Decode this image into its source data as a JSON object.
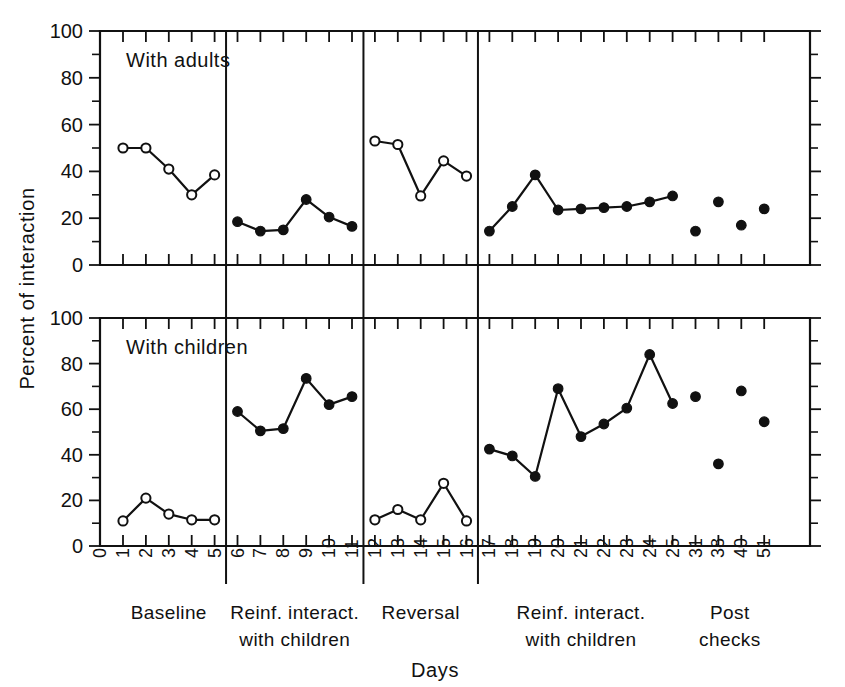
{
  "figure": {
    "xaxis_title": "Days",
    "yaxis_title": "Percent of interaction"
  },
  "panels": [
    {
      "key": "adults",
      "title": "With adults"
    },
    {
      "key": "children",
      "title": "With children"
    }
  ],
  "y_ticks": [
    "0",
    "20",
    "40",
    "60",
    "80",
    "100"
  ],
  "x_ticks": [
    "0",
    "1",
    "2",
    "3",
    "4",
    "5",
    "6",
    "7",
    "8",
    "9",
    "10",
    "11",
    "12",
    "13",
    "14",
    "15",
    "16",
    "17",
    "18",
    "19",
    "20",
    "21",
    "22",
    "23",
    "24",
    "25",
    "31",
    "38",
    "40",
    "51"
  ],
  "phase_labels": [
    {
      "line1": "Baseline",
      "line2": ""
    },
    {
      "line1": "Reinf. interact.",
      "line2": "with children"
    },
    {
      "line1": "Reversal",
      "line2": ""
    },
    {
      "line1": "Reinf. interact.",
      "line2": "with children"
    },
    {
      "line1": "Post",
      "line2": "checks"
    }
  ],
  "chart_data": {
    "type": "line",
    "title": "",
    "xlabel": "Days",
    "ylabel": "Percent of interaction",
    "xlim": [
      0,
      30
    ],
    "ylim": [
      0,
      100
    ],
    "grid": false,
    "legend": "none",
    "y_tick_values": [
      0,
      20,
      40,
      60,
      80,
      100
    ],
    "y_minor_tick_values": [
      10,
      30,
      50,
      70,
      90
    ],
    "phase_boundaries_after_day": [
      5,
      11,
      16,
      25
    ],
    "panels": [
      {
        "name": "With adults",
        "series": [
          {
            "name": "Baseline",
            "marker": "open",
            "connected": true,
            "x": [
              1,
              2,
              3,
              4,
              5
            ],
            "values": [
              50,
              50,
              41,
              30,
              38.5
            ]
          },
          {
            "name": "Reinf. interact. with children",
            "marker": "filled",
            "connected": true,
            "x": [
              6,
              7,
              8,
              9,
              10,
              11
            ],
            "values": [
              18.5,
              14.5,
              15,
              28,
              20.5,
              16.5
            ]
          },
          {
            "name": "Reversal",
            "marker": "open",
            "connected": true,
            "x": [
              12,
              13,
              14,
              15,
              16
            ],
            "values": [
              53,
              51.5,
              29.5,
              44.5,
              38
            ]
          },
          {
            "name": "Reinf. interact. with children 2",
            "marker": "filled",
            "connected": true,
            "x": [
              17,
              18,
              19,
              20,
              21,
              22,
              23,
              24,
              25
            ],
            "values": [
              14.5,
              25,
              38.5,
              23.5,
              24,
              24.5,
              25,
              27,
              29.5
            ]
          },
          {
            "name": "Post checks",
            "marker": "filled",
            "connected": false,
            "x": [
              31,
              38,
              40,
              51
            ],
            "values": [
              14.5,
              27,
              17,
              24
            ]
          }
        ]
      },
      {
        "name": "With children",
        "series": [
          {
            "name": "Baseline",
            "marker": "open",
            "connected": true,
            "x": [
              1,
              2,
              3,
              4,
              5
            ],
            "values": [
              11,
              21,
              14,
              11.5,
              11.5
            ]
          },
          {
            "name": "Reinf. interact. with children",
            "marker": "filled",
            "connected": true,
            "x": [
              6,
              7,
              8,
              9,
              10,
              11
            ],
            "values": [
              59,
              50.5,
              51.5,
              73.5,
              62,
              65.5
            ]
          },
          {
            "name": "Reversal",
            "marker": "open",
            "connected": true,
            "x": [
              12,
              13,
              14,
              15,
              16
            ],
            "values": [
              11.5,
              16,
              11.5,
              27.5,
              11
            ]
          },
          {
            "name": "Reinf. interact. with children 2",
            "marker": "filled",
            "connected": true,
            "x": [
              17,
              18,
              19,
              20,
              21,
              22,
              23,
              24,
              25
            ],
            "values": [
              42.5,
              39.5,
              30.5,
              69,
              48,
              53.5,
              60.5,
              84,
              62.5
            ]
          },
          {
            "name": "Post checks",
            "marker": "filled",
            "connected": false,
            "x": [
              31,
              38,
              40,
              51
            ],
            "values": [
              65.5,
              36,
              68,
              54.5
            ]
          }
        ]
      }
    ]
  }
}
